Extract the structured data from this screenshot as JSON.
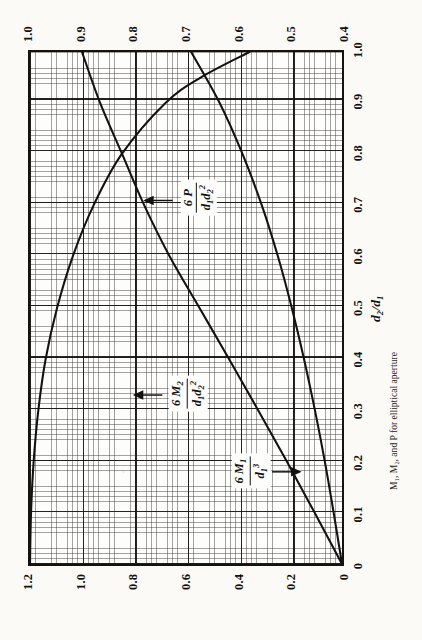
{
  "figure": {
    "caption": "M₁, M₂, and P for elliptical aperture",
    "background_color": "#fbfaf7",
    "ink_color": "#141210"
  },
  "axes": {
    "x": {
      "title": "d₂/d₁",
      "ticks": [
        "0",
        "0.1",
        "0.2",
        "0.3",
        "0.4",
        "0.5",
        "0.6",
        "0.7",
        "0.8",
        "0.9",
        "1.0"
      ],
      "min": 0,
      "max": 1.0
    },
    "y_left": {
      "ticks": [
        "0",
        "0.2",
        "0.4",
        "0.6",
        "0.8",
        "1.0",
        "1.2"
      ],
      "min": 0,
      "max": 1.2
    },
    "y_right": {
      "ticks": [
        "0.4",
        "0.5",
        "0.6",
        "0.7",
        "0.8",
        "0.9",
        "1.0"
      ],
      "min": 0.4,
      "max": 1.0
    }
  },
  "curve_labels": {
    "m2": {
      "num_base": "6 M",
      "num_sub": "2",
      "den_base": "d",
      "den_sub1": "1",
      "den_base2": "d",
      "den_sub2": "2",
      "den_sup2": "2"
    },
    "p": {
      "num_base": "6 P",
      "num_sub": "",
      "den_base": "d",
      "den_sub1": "1",
      "den_base2": "d",
      "den_sub2": "2",
      "den_sup2": "2"
    },
    "m1": {
      "num_base": "6 M",
      "num_sub": "1",
      "den_base": "d",
      "den_sub1": "1",
      "den_sup1": "3"
    }
  },
  "chart_data": {
    "type": "line",
    "title": "",
    "xlabel": "d₂/d₁",
    "ylabel": "",
    "xlim": [
      0,
      1.0
    ],
    "ylim": [
      0,
      1.2
    ],
    "y2lim": [
      0.4,
      1.0
    ],
    "grid": true,
    "grid_minor_divisions": 10,
    "legend": "inline-labels-with-arrows",
    "series": [
      {
        "name": "6 M2 / (d1 d2^2)",
        "axis": "left",
        "arrow": "up-to-left-axis",
        "label_x": 0.33,
        "label_y": 0.6,
        "x": [
          0.0,
          0.1,
          0.2,
          0.3,
          0.4,
          0.5,
          0.6,
          0.7,
          0.8,
          0.9,
          1.0
        ],
        "values": [
          0.0,
          0.105,
          0.212,
          0.322,
          0.434,
          0.548,
          0.662,
          0.76,
          0.845,
          0.93,
          1.0
        ]
      },
      {
        "name": "6 M1 / d1^3",
        "axis": "left",
        "arrow": "down-to-left-axis",
        "label_x": 0.18,
        "label_y": 0.36,
        "x": [
          0.0,
          0.1,
          0.2,
          0.3,
          0.4,
          0.5,
          0.6,
          0.7,
          0.8,
          0.9,
          1.0
        ],
        "values": [
          0.0,
          0.032,
          0.066,
          0.104,
          0.146,
          0.193,
          0.246,
          0.308,
          0.382,
          0.47,
          0.58
        ]
      },
      {
        "name": "6 P / (d1 d2^2)",
        "axis": "right",
        "arrow": "up-to-right-axis",
        "label_x": 0.71,
        "label_y": 0.68,
        "x": [
          0.0,
          0.1,
          0.2,
          0.3,
          0.4,
          0.5,
          0.6,
          0.7,
          0.8,
          0.9,
          0.95,
          1.0
        ],
        "values": [
          1.0,
          0.998,
          0.993,
          0.984,
          0.97,
          0.948,
          0.918,
          0.878,
          0.824,
          0.74,
          0.672,
          0.578
        ]
      }
    ]
  }
}
